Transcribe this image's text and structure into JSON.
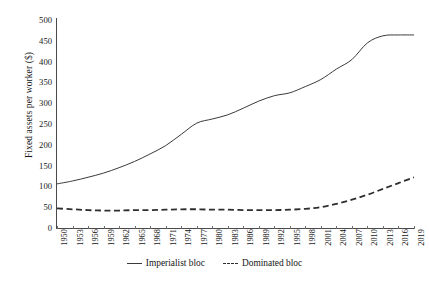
{
  "chart_data": {
    "type": "line",
    "title": "",
    "xlabel": "",
    "ylabel": "Fixed assets per worker ($)",
    "ylim": [
      0,
      500
    ],
    "ytick_step": 50,
    "yticks": [
      0,
      50,
      100,
      150,
      200,
      250,
      300,
      350,
      400,
      450,
      500
    ],
    "xlim": [
      1950,
      2019
    ],
    "xticks": [
      1950,
      1953,
      1956,
      1959,
      1962,
      1965,
      1968,
      1971,
      1974,
      1977,
      1980,
      1983,
      1986,
      1989,
      1992,
      1995,
      1998,
      2001,
      2004,
      2007,
      2010,
      2013,
      2016,
      2019
    ],
    "grid": false,
    "legend_position": "bottom",
    "x": [
      1950,
      1953,
      1956,
      1959,
      1962,
      1965,
      1968,
      1971,
      1974,
      1977,
      1980,
      1983,
      1986,
      1989,
      1992,
      1995,
      1998,
      2001,
      2004,
      2007,
      2010,
      2013,
      2016,
      2019
    ],
    "series": [
      {
        "name": "Imperialist bloc",
        "style": "solid",
        "color": "#3a3a3a",
        "values": [
          106,
          113,
          122,
          132,
          145,
          160,
          178,
          198,
          225,
          252,
          262,
          272,
          288,
          305,
          318,
          325,
          340,
          357,
          382,
          405,
          445,
          462,
          464,
          464
        ]
      },
      {
        "name": "Dominated bloc",
        "style": "dashed",
        "color": "#2e2e2e",
        "values": [
          47,
          45,
          43,
          42,
          42,
          43,
          43,
          44,
          45,
          45,
          44,
          44,
          43,
          43,
          43,
          44,
          46,
          50,
          58,
          68,
          80,
          94,
          108,
          122
        ]
      }
    ]
  },
  "legend": {
    "items": [
      {
        "label": "Imperialist bloc",
        "style": "solid"
      },
      {
        "label": "Dominated bloc",
        "style": "dashed"
      }
    ]
  }
}
